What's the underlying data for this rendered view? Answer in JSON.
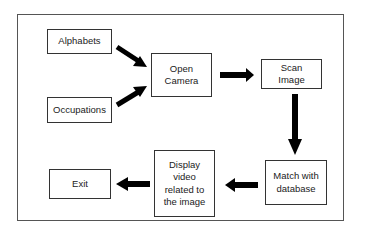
{
  "diagram": {
    "type": "flowchart",
    "nodes": [
      {
        "id": "alphabets",
        "label": "Alphabets"
      },
      {
        "id": "occupations",
        "label": "Occupations"
      },
      {
        "id": "open_camera",
        "label": "Open\nCamera"
      },
      {
        "id": "scan_image",
        "label": "Scan\nImage"
      },
      {
        "id": "match_db",
        "label": "Match with\ndatabase"
      },
      {
        "id": "display_video",
        "label": "Display\nvideo\nrelated to\nthe image"
      },
      {
        "id": "exit",
        "label": "Exit"
      }
    ],
    "edges": [
      {
        "from": "alphabets",
        "to": "open_camera"
      },
      {
        "from": "occupations",
        "to": "open_camera"
      },
      {
        "from": "open_camera",
        "to": "scan_image"
      },
      {
        "from": "scan_image",
        "to": "match_db"
      },
      {
        "from": "match_db",
        "to": "display_video"
      },
      {
        "from": "display_video",
        "to": "exit"
      }
    ],
    "colors": {
      "stroke": "#333333",
      "arrow": "#000000",
      "background": "#ffffff"
    }
  }
}
